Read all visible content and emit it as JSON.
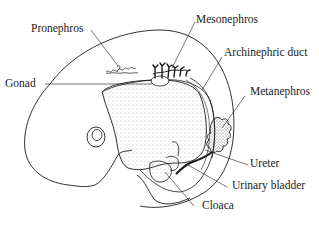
{
  "diagram": {
    "colors": {
      "ink": "#1a1a1a",
      "background": "#ffffff"
    },
    "labels": [
      {
        "id": "pronephros",
        "text": "Pronephros"
      },
      {
        "id": "mesonephros",
        "text": "Mesonephros"
      },
      {
        "id": "archinephric_duct",
        "text": "Archinephric duct"
      },
      {
        "id": "gonad",
        "text": "Gonad"
      },
      {
        "id": "metanephros",
        "text": "Metanephros"
      },
      {
        "id": "ureter",
        "text": "Ureter"
      },
      {
        "id": "urinary_bladder",
        "text": "Urinary bladder"
      },
      {
        "id": "cloaca",
        "text": "Cloaca"
      }
    ]
  }
}
